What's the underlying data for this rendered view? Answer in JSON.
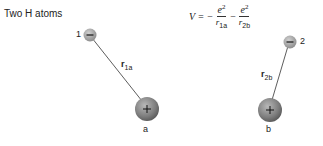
{
  "title": "Two H atoms",
  "formula": {
    "lhs": "V =",
    "minus1": "−",
    "term1": {
      "numerator": "e",
      "exponent": "2",
      "denominator": "r",
      "sub": "1a"
    },
    "minus2": "−",
    "term2": {
      "numerator": "e",
      "exponent": "2",
      "denominator": "r",
      "sub": "2b"
    }
  },
  "electrons": [
    {
      "label": "1",
      "symbol": "−"
    },
    {
      "label": "2",
      "symbol": "−"
    }
  ],
  "nuclei": [
    {
      "label": "a",
      "symbol": "+"
    },
    {
      "label": "b",
      "symbol": "+"
    }
  ],
  "distances": [
    {
      "base": "r",
      "sub": "1a"
    },
    {
      "base": "r",
      "sub": "2b"
    }
  ],
  "colors": {
    "particle": "#8a8a8a",
    "particle_dark": "#5a5a5a",
    "line": "#333333"
  }
}
